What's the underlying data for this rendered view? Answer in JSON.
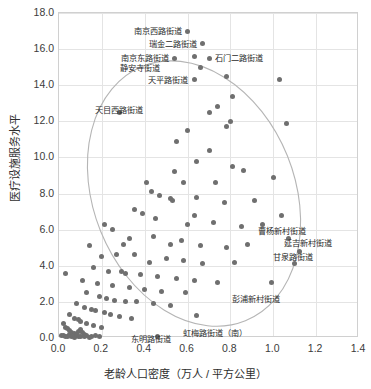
{
  "chart_data": {
    "type": "scatter",
    "title": "",
    "xlabel": "老龄人口密度（万人 / 平方公里）",
    "ylabel": "医疗设施服务水平",
    "xlim": [
      0.0,
      1.4
    ],
    "ylim": [
      0.0,
      18.0
    ],
    "xticks": [
      "0.0",
      "0.2",
      "0.4",
      "0.6",
      "0.8",
      "1.0",
      "1.2",
      "1.4"
    ],
    "xtick_values": [
      0.0,
      0.2,
      0.4,
      0.6,
      0.8,
      1.0,
      1.2,
      1.4
    ],
    "yticks": [
      "0.0",
      "2.0",
      "4.0",
      "6.0",
      "8.0",
      "10.0",
      "12.0",
      "14.0",
      "16.0",
      "18.0"
    ],
    "ytick_values": [
      0.0,
      2.0,
      4.0,
      6.0,
      8.0,
      10.0,
      12.0,
      14.0,
      16.0,
      18.0
    ],
    "grid": true,
    "legend": "none",
    "point_color": "#6f6f6f",
    "ellipse_color": "#b5b5b5",
    "ellipse": {
      "cx": 0.63,
      "cy": 8.0,
      "rx": 0.47,
      "ry": 7.6,
      "rotation_deg": -22
    },
    "points": [
      {
        "x": 0.6,
        "y": 17.0
      },
      {
        "x": 0.67,
        "y": 16.3
      },
      {
        "x": 0.63,
        "y": 15.6
      },
      {
        "x": 0.7,
        "y": 15.5
      },
      {
        "x": 0.54,
        "y": 15.5
      },
      {
        "x": 0.66,
        "y": 15.0
      },
      {
        "x": 0.63,
        "y": 14.3
      },
      {
        "x": 0.78,
        "y": 14.5
      },
      {
        "x": 1.03,
        "y": 14.3
      },
      {
        "x": 0.28,
        "y": 12.5
      },
      {
        "x": 0.81,
        "y": 13.4
      },
      {
        "x": 0.74,
        "y": 12.8
      },
      {
        "x": 0.7,
        "y": 12.5
      },
      {
        "x": 0.8,
        "y": 12.0
      },
      {
        "x": 0.78,
        "y": 11.7
      },
      {
        "x": 1.06,
        "y": 11.9
      },
      {
        "x": 0.6,
        "y": 11.5
      },
      {
        "x": 0.55,
        "y": 10.9
      },
      {
        "x": 0.7,
        "y": 10.4
      },
      {
        "x": 0.64,
        "y": 9.8
      },
      {
        "x": 0.54,
        "y": 9.2
      },
      {
        "x": 0.81,
        "y": 9.5
      },
      {
        "x": 0.86,
        "y": 9.3
      },
      {
        "x": 0.58,
        "y": 8.6
      },
      {
        "x": 0.73,
        "y": 8.6
      },
      {
        "x": 1.0,
        "y": 8.9
      },
      {
        "x": 0.41,
        "y": 8.6
      },
      {
        "x": 0.43,
        "y": 8.1
      },
      {
        "x": 0.47,
        "y": 7.9
      },
      {
        "x": 0.52,
        "y": 7.7
      },
      {
        "x": 0.53,
        "y": 7.6
      },
      {
        "x": 0.64,
        "y": 7.8
      },
      {
        "x": 0.77,
        "y": 7.5
      },
      {
        "x": 0.91,
        "y": 7.6
      },
      {
        "x": 1.04,
        "y": 6.8
      },
      {
        "x": 0.35,
        "y": 7.1
      },
      {
        "x": 0.39,
        "y": 6.9
      },
      {
        "x": 0.45,
        "y": 6.6
      },
      {
        "x": 0.6,
        "y": 6.3
      },
      {
        "x": 0.63,
        "y": 6.8
      },
      {
        "x": 0.72,
        "y": 6.4
      },
      {
        "x": 0.85,
        "y": 6.2
      },
      {
        "x": 0.95,
        "y": 6.3
      },
      {
        "x": 1.07,
        "y": 5.5
      },
      {
        "x": 0.21,
        "y": 6.3
      },
      {
        "x": 0.25,
        "y": 6.0
      },
      {
        "x": 0.33,
        "y": 5.5
      },
      {
        "x": 0.3,
        "y": 5.2
      },
      {
        "x": 0.44,
        "y": 5.6
      },
      {
        "x": 0.52,
        "y": 5.2
      },
      {
        "x": 0.57,
        "y": 5.4
      },
      {
        "x": 0.66,
        "y": 5.1
      },
      {
        "x": 0.78,
        "y": 5.0
      },
      {
        "x": 0.88,
        "y": 5.2
      },
      {
        "x": 1.12,
        "y": 4.8
      },
      {
        "x": 0.14,
        "y": 5.1
      },
      {
        "x": 0.2,
        "y": 4.5
      },
      {
        "x": 0.27,
        "y": 4.6
      },
      {
        "x": 0.35,
        "y": 4.6
      },
      {
        "x": 0.42,
        "y": 4.2
      },
      {
        "x": 0.5,
        "y": 4.4
      },
      {
        "x": 0.58,
        "y": 4.3
      },
      {
        "x": 0.67,
        "y": 4.1
      },
      {
        "x": 0.82,
        "y": 4.2
      },
      {
        "x": 1.1,
        "y": 4.1
      },
      {
        "x": 0.16,
        "y": 3.9
      },
      {
        "x": 0.23,
        "y": 3.7
      },
      {
        "x": 0.29,
        "y": 3.7
      },
      {
        "x": 0.31,
        "y": 3.6
      },
      {
        "x": 0.38,
        "y": 3.5
      },
      {
        "x": 0.46,
        "y": 3.4
      },
      {
        "x": 0.55,
        "y": 3.3
      },
      {
        "x": 0.63,
        "y": 3.2
      },
      {
        "x": 0.74,
        "y": 3.1
      },
      {
        "x": 0.99,
        "y": 3.1
      },
      {
        "x": 0.03,
        "y": 3.6
      },
      {
        "x": 0.11,
        "y": 3.2
      },
      {
        "x": 0.18,
        "y": 3.0
      },
      {
        "x": 0.25,
        "y": 2.9
      },
      {
        "x": 0.33,
        "y": 2.8
      },
      {
        "x": 0.4,
        "y": 2.7
      },
      {
        "x": 0.48,
        "y": 2.6
      },
      {
        "x": 0.59,
        "y": 2.5
      },
      {
        "x": 0.13,
        "y": 2.5
      },
      {
        "x": 0.19,
        "y": 2.3
      },
      {
        "x": 0.22,
        "y": 2.2
      },
      {
        "x": 0.26,
        "y": 2.1
      },
      {
        "x": 0.31,
        "y": 2.0
      },
      {
        "x": 0.36,
        "y": 2.0
      },
      {
        "x": 0.44,
        "y": 1.9
      },
      {
        "x": 0.52,
        "y": 1.8
      },
      {
        "x": 0.08,
        "y": 1.9
      },
      {
        "x": 0.12,
        "y": 1.7
      },
      {
        "x": 0.15,
        "y": 1.6
      },
      {
        "x": 0.17,
        "y": 1.5
      },
      {
        "x": 0.21,
        "y": 1.4
      },
      {
        "x": 0.24,
        "y": 1.3
      },
      {
        "x": 0.28,
        "y": 1.2
      },
      {
        "x": 0.34,
        "y": 1.1
      },
      {
        "x": 0.05,
        "y": 1.3
      },
      {
        "x": 0.07,
        "y": 1.1
      },
      {
        "x": 0.09,
        "y": 1.0
      },
      {
        "x": 0.1,
        "y": 0.9
      },
      {
        "x": 0.13,
        "y": 0.8
      },
      {
        "x": 0.16,
        "y": 0.7
      },
      {
        "x": 0.2,
        "y": 0.6
      },
      {
        "x": 0.02,
        "y": 0.8
      },
      {
        "x": 0.03,
        "y": 0.6
      },
      {
        "x": 0.04,
        "y": 0.5
      },
      {
        "x": 0.05,
        "y": 0.4
      },
      {
        "x": 0.06,
        "y": 0.3
      },
      {
        "x": 0.07,
        "y": 0.25
      },
      {
        "x": 0.08,
        "y": 0.2
      },
      {
        "x": 0.09,
        "y": 0.35
      },
      {
        "x": 0.1,
        "y": 0.45
      },
      {
        "x": 0.11,
        "y": 0.3
      },
      {
        "x": 0.12,
        "y": 0.22
      },
      {
        "x": 0.01,
        "y": 0.15
      },
      {
        "x": 0.02,
        "y": 0.12
      },
      {
        "x": 0.03,
        "y": 0.1
      },
      {
        "x": 0.04,
        "y": 0.08
      },
      {
        "x": 0.05,
        "y": 0.18
      },
      {
        "x": 0.06,
        "y": 0.1
      },
      {
        "x": 0.07,
        "y": 0.05
      },
      {
        "x": 0.08,
        "y": 0.12
      },
      {
        "x": 0.09,
        "y": 0.06
      },
      {
        "x": 0.1,
        "y": 0.1
      },
      {
        "x": 0.12,
        "y": 0.08
      },
      {
        "x": 0.13,
        "y": 0.15
      },
      {
        "x": 0.14,
        "y": 0.05
      },
      {
        "x": 0.15,
        "y": 0.1
      },
      {
        "x": 0.17,
        "y": 0.12
      },
      {
        "x": 0.19,
        "y": 0.1
      },
      {
        "x": 0.46,
        "y": 0.1
      },
      {
        "x": 0.64,
        "y": 1.25
      }
    ],
    "annotations": [
      {
        "label": "南京西路街道",
        "x": 0.6,
        "y": 17.0,
        "side": "left"
      },
      {
        "label": "瑞金二路街道",
        "x": 0.67,
        "y": 16.3,
        "side": "left"
      },
      {
        "label": "南京东路街道",
        "x": 0.54,
        "y": 15.5,
        "side": "left"
      },
      {
        "label": "石门二路街道",
        "x": 0.7,
        "y": 15.5,
        "side": "right"
      },
      {
        "label": "静安寺街道",
        "x": 0.5,
        "y": 14.95,
        "side": "left"
      },
      {
        "label": "天平路街道",
        "x": 0.63,
        "y": 14.3,
        "side": "left"
      },
      {
        "label": "天目西路街道",
        "x": 0.28,
        "y": 13.1,
        "side": "below"
      },
      {
        "label": "曹杨新村街道",
        "x": 0.9,
        "y": 5.95,
        "side": "right"
      },
      {
        "label": "延吉新村街道",
        "x": 1.02,
        "y": 5.25,
        "side": "right"
      },
      {
        "label": "甘泉路街道",
        "x": 0.97,
        "y": 4.5,
        "side": "right"
      },
      {
        "label": "彭浦新村街道",
        "x": 0.92,
        "y": 2.65,
        "side": "below"
      },
      {
        "label": "虹梅路街道（南）",
        "x": 0.73,
        "y": 0.75,
        "side": "below"
      },
      {
        "label": "东明路街道",
        "x": 0.43,
        "y": 0.45,
        "side": "below"
      }
    ]
  }
}
